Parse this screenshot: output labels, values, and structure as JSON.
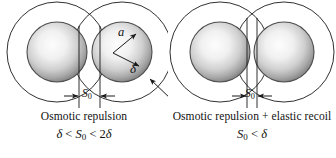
{
  "figure": {
    "type": "scientific-schematic",
    "background_color": "#ffffff",
    "line_color": "#1a1a1a",
    "sphere_edge_color": "#4a4a4a",
    "sphere_highlight_color": "#f2f2f2",
    "sphere_shadow_color": "#8c8c8c"
  },
  "panels": [
    {
      "id": "left",
      "caption_title": "Osmotic repulsion",
      "caption_formula": "δ < S₀ < 2δ",
      "formula_parts": {
        "delta_left": "δ",
        "op1": "<",
        "gap_symbol": "S",
        "gap_subscript": "0",
        "op2": "<",
        "coefficient": "2",
        "delta_right": "δ"
      },
      "labels": {
        "radius": "a",
        "shell_thickness": "δ",
        "separation": "S",
        "separation_subscript": "0"
      },
      "geometry": {
        "sphere_radius": 30,
        "outer_radius": 72,
        "left_center_x": 57,
        "right_center_x": 122,
        "center_y": 52,
        "separation_gap": 22
      }
    },
    {
      "id": "right",
      "caption_title": "Osmotic repulsion + elastic recoil",
      "caption_formula": "S₀ < δ",
      "formula_parts": {
        "gap_symbol": "S",
        "gap_subscript": "0",
        "op1": "<",
        "delta_right": "δ"
      },
      "labels": {
        "separation": "S",
        "separation_subscript": "0"
      },
      "geometry": {
        "sphere_radius": 30,
        "outer_radius": 72,
        "left_center_x": 52,
        "right_center_x": 116,
        "center_y": 52,
        "separation_gap": 10
      }
    }
  ],
  "annotations": {
    "radius_arrow": "a",
    "shell_arrow": "δ",
    "pointer_arrow": "outer-shell-pointer"
  }
}
